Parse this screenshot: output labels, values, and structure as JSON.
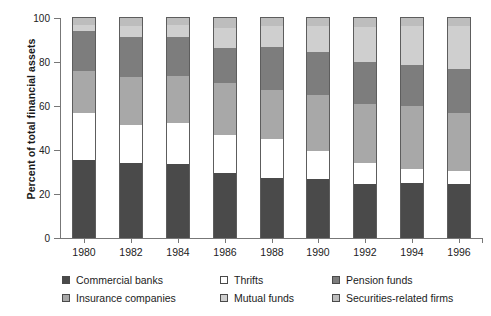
{
  "chart_data": {
    "type": "bar",
    "subtype": "stacked-bar-100-percent",
    "title": "",
    "xlabel": "",
    "ylabel": "Percent of total financial assets",
    "ylim": [
      0,
      100
    ],
    "yticks": [
      0,
      20,
      40,
      60,
      80,
      100
    ],
    "ytick_labels": [
      "0",
      "20",
      "40",
      "60",
      "80",
      "100"
    ],
    "grid": false,
    "legend_position": "bottom",
    "categories": [
      "1980",
      "1982",
      "1984",
      "1986",
      "1988",
      "1990",
      "1992",
      "1994",
      "1996"
    ],
    "series": [
      {
        "name": "Commercial banks",
        "color": "#4a4a4a",
        "values": [
          35.5,
          34.0,
          33.5,
          29.5,
          27.5,
          27.0,
          24.5,
          25.0,
          24.5
        ]
      },
      {
        "name": "Thrifts",
        "color": "#ffffff",
        "values": [
          21.5,
          17.5,
          19.0,
          17.5,
          17.5,
          12.5,
          9.5,
          6.5,
          6.0
        ]
      },
      {
        "name": "Insurance companies",
        "color": "#a8a8a8",
        "values": [
          19.0,
          21.5,
          21.0,
          23.5,
          22.5,
          25.5,
          27.0,
          28.5,
          26.5
        ]
      },
      {
        "name": "Pension funds",
        "color": "#7d7d7d",
        "values": [
          18.0,
          18.5,
          18.0,
          16.0,
          19.5,
          19.5,
          19.0,
          18.5,
          20.0
        ]
      },
      {
        "name": "Mutual funds",
        "color": "#cfcfcf",
        "values": [
          3.0,
          5.0,
          5.5,
          9.0,
          9.5,
          12.0,
          16.0,
          18.0,
          19.5
        ]
      },
      {
        "name": "Securities-related firms",
        "color": "#bdbdbd",
        "values": [
          3.0,
          3.5,
          3.0,
          4.5,
          3.5,
          3.5,
          4.0,
          3.5,
          3.5
        ]
      }
    ]
  },
  "axis": {
    "y_title": "Percent of total financial assets"
  },
  "legend": {
    "columns": [
      {
        "items": [
          {
            "label": "Commercial banks",
            "color": "#4a4a4a"
          },
          {
            "label": "Insurance companies",
            "color": "#a8a8a8"
          }
        ]
      },
      {
        "items": [
          {
            "label": "Thrifts",
            "color": "#ffffff"
          },
          {
            "label": "Mutual funds",
            "color": "#cfcfcf"
          }
        ]
      },
      {
        "items": [
          {
            "label": "Pension funds",
            "color": "#7d7d7d"
          },
          {
            "label": "Securities-related firms",
            "color": "#bdbdbd"
          }
        ]
      }
    ]
  }
}
